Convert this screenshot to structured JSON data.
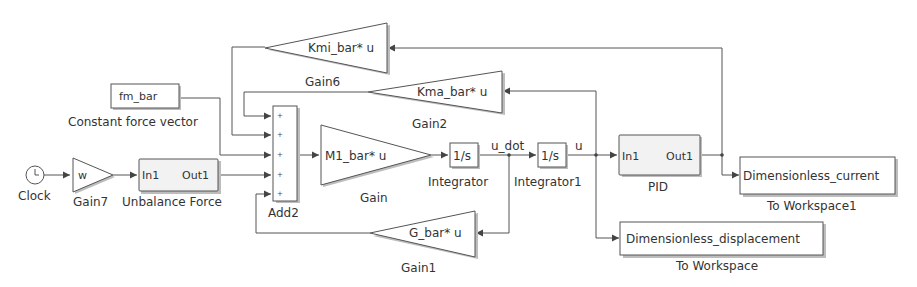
{
  "diagram": {
    "blocks": {
      "clock": {
        "label": "Clock"
      },
      "gain7": {
        "label": "Gain7",
        "value": "w"
      },
      "unbalance_force": {
        "label": "Unbalance Force",
        "in_port": "In1",
        "out_port": "Out1"
      },
      "constant": {
        "label": "Constant force vector",
        "value": "fm_bar"
      },
      "add2": {
        "label": "Add2",
        "signs": [
          "+",
          "+",
          "+",
          "+",
          "+"
        ]
      },
      "gain": {
        "label": "Gain",
        "value": "M1_bar* u"
      },
      "integrator": {
        "label": "Integrator",
        "value": "1/s"
      },
      "integrator1": {
        "label": "Integrator1",
        "value": "1/s"
      },
      "pid": {
        "label": "PID",
        "in_port": "In1",
        "out_port": "Out1"
      },
      "to_workspace1": {
        "label": "To Workspace1",
        "value": "Dimensionless_current"
      },
      "to_workspace": {
        "label": "To Workspace",
        "value": "Dimensionless_displacement"
      },
      "gain6": {
        "label": "Gain6",
        "value": "Kmi_bar* u"
      },
      "gain2": {
        "label": "Gain2",
        "value": "Kma_bar* u"
      },
      "gain1": {
        "label": "Gain1",
        "value": "G_bar* u"
      }
    },
    "signals": {
      "u_dot": "u_dot",
      "u": "u"
    },
    "colors": {
      "line": "#555555",
      "block_fill": "#ffffff",
      "subsystem_fill": "#f2f2f2",
      "text": "#333333"
    }
  }
}
